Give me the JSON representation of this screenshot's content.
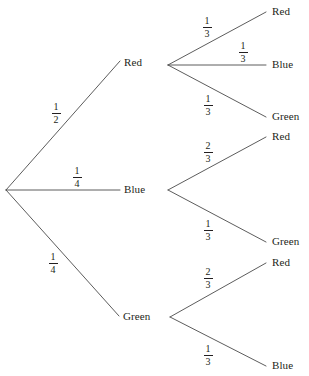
{
  "diagram": {
    "type": "probability-tree",
    "root": {
      "name": "root",
      "x": 6,
      "y": 190
    },
    "level1": [
      {
        "id": "l1-red",
        "label": "Red",
        "probability": "1/2",
        "probability_numerator": "1",
        "probability_denominator": "2",
        "label_x": 124,
        "label_y": 57,
        "branch_x": 168,
        "branch_y": 65,
        "frac_x": 47,
        "frac_y": 102
      },
      {
        "id": "l1-blue",
        "label": "Blue",
        "probability": "1/4",
        "probability_numerator": "1",
        "probability_denominator": "4",
        "label_x": 124,
        "label_y": 184,
        "branch_x": 168,
        "branch_y": 190,
        "frac_x": 68,
        "frac_y": 166
      },
      {
        "id": "l1-green",
        "label": "Green",
        "probability": "1/4",
        "probability_numerator": "1",
        "probability_denominator": "4",
        "label_x": 123,
        "label_y": 311,
        "branch_x": 170,
        "branch_y": 317,
        "frac_x": 44,
        "frac_y": 252
      }
    ],
    "level2": [
      {
        "id": "l2-red-red",
        "parent": "l1-red",
        "label": "Red",
        "probability": "1/3",
        "probability_numerator": "1",
        "probability_denominator": "3",
        "label_x": 272,
        "label_y": 6,
        "end_x": 267,
        "end_y": 12,
        "frac_x": 198,
        "frac_y": 16
      },
      {
        "id": "l2-red-blue",
        "parent": "l1-red",
        "label": "Blue",
        "probability": "1/3",
        "probability_numerator": "1",
        "probability_denominator": "3",
        "label_x": 272,
        "label_y": 59,
        "end_x": 267,
        "end_y": 65,
        "frac_x": 234,
        "frac_y": 41
      },
      {
        "id": "l2-red-green",
        "parent": "l1-red",
        "label": "Green",
        "probability": "1/3",
        "probability_numerator": "1",
        "probability_denominator": "3",
        "label_x": 272,
        "label_y": 111,
        "end_x": 267,
        "end_y": 117,
        "frac_x": 199,
        "frac_y": 94
      },
      {
        "id": "l2-blue-red",
        "parent": "l1-blue",
        "label": "Red",
        "probability": "2/3",
        "probability_numerator": "2",
        "probability_denominator": "3",
        "label_x": 272,
        "label_y": 131,
        "end_x": 267,
        "end_y": 137,
        "frac_x": 199,
        "frac_y": 141
      },
      {
        "id": "l2-blue-green",
        "parent": "l1-blue",
        "label": "Green",
        "probability": "1/3",
        "probability_numerator": "1",
        "probability_denominator": "3",
        "label_x": 272,
        "label_y": 236,
        "end_x": 267,
        "end_y": 242,
        "frac_x": 199,
        "frac_y": 219
      },
      {
        "id": "l2-green-red",
        "parent": "l1-green",
        "label": "Red",
        "probability": "2/3",
        "probability_numerator": "2",
        "probability_denominator": "3",
        "label_x": 272,
        "label_y": 257,
        "end_x": 267,
        "end_y": 263,
        "frac_x": 199,
        "frac_y": 267
      },
      {
        "id": "l2-green-blue",
        "parent": "l1-green",
        "label": "Blue",
        "probability": "1/3",
        "probability_numerator": "1",
        "probability_denominator": "3",
        "label_x": 272,
        "label_y": 360,
        "end_x": 267,
        "end_y": 366,
        "frac_x": 199,
        "frac_y": 344
      }
    ],
    "style": {
      "line_color": "#4a4a4a",
      "text_color": "#231f20",
      "background": "#ffffff",
      "line_width": "0.9"
    }
  }
}
